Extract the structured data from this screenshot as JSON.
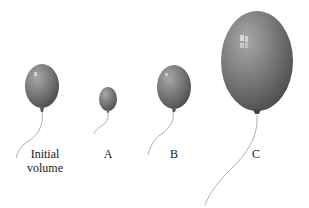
{
  "figure": {
    "balloon_color": "#7a7a7a",
    "balloon_dark": "#4a4a4a",
    "highlight": "#d8d8d8",
    "string_color": "#9a9a9a"
  },
  "labels": {
    "initial": "Initial",
    "initial_line2": "volume",
    "a": "A",
    "b": "B",
    "c": "C"
  }
}
